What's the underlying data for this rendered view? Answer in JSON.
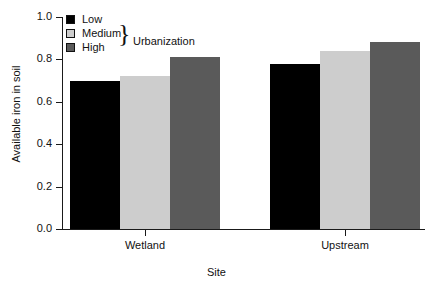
{
  "chart_data": {
    "type": "bar",
    "title": "",
    "subtitle": "",
    "xlabel": "Site",
    "ylabel": "Available iron in soil",
    "categories": [
      "Wetland",
      "Upstream"
    ],
    "series": [
      {
        "name": "Low",
        "values": [
          0.7,
          0.78
        ],
        "color": "#000000"
      },
      {
        "name": "Medium",
        "values": [
          0.72,
          0.84
        ],
        "color": "#cdcdcd"
      },
      {
        "name": "High",
        "values": [
          0.81,
          0.88
        ],
        "color": "#5a5a5a"
      }
    ],
    "ylim": [
      0.0,
      1.0
    ],
    "yticks": [
      "0.0",
      "0.2",
      "0.4",
      "0.6",
      "0.8",
      "1.0"
    ],
    "ytick_values": [
      0.0,
      0.2,
      0.4,
      0.6,
      0.8,
      1.0
    ],
    "xtick_labels": [
      "Wetland",
      "Upstream"
    ],
    "grid": false,
    "legend_position": "top-left",
    "legend_group_title": "Urbanization",
    "legend_brace_glyph": "}",
    "grouping": "grouped",
    "axis_color": "#1a1a1a",
    "background": "#ffffff"
  },
  "legend": {
    "entries": [
      {
        "label": "Low",
        "color": "#000000"
      },
      {
        "label": "Medium",
        "color": "#cdcdcd"
      },
      {
        "label": "High",
        "color": "#5a5a5a"
      }
    ],
    "brace": "}",
    "group_title": "Urbanization"
  },
  "axes": {
    "y_title": "Available iron in soil",
    "x_title": "Site"
  }
}
